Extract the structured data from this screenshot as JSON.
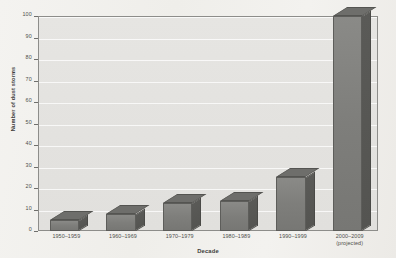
{
  "chart_data": {
    "type": "bar",
    "title": "",
    "xlabel": "Decade",
    "ylabel": "Number of dust storms",
    "categories": [
      "1950–1959",
      "1960–1969",
      "1970–1979",
      "1980–1989",
      "1990–1999",
      "2000–2009\n(projected)"
    ],
    "category_lines": [
      [
        "1950–1959"
      ],
      [
        "1960–1969"
      ],
      [
        "1970–1979"
      ],
      [
        "1980–1989"
      ],
      [
        "1990–1999"
      ],
      [
        "2000–2009",
        "(projected)"
      ]
    ],
    "values": [
      5,
      8,
      13,
      14,
      25,
      100
    ],
    "ylim": [
      0,
      100
    ],
    "yticks": [
      0,
      10,
      20,
      30,
      40,
      50,
      60,
      70,
      80,
      90,
      100
    ],
    "ytick_labels": [
      "0",
      "10",
      "20",
      "30",
      "40",
      "50",
      "60",
      "70",
      "80",
      "90",
      "100"
    ],
    "grid": true,
    "grid_axis": "y",
    "legend": "none",
    "bar_style": "3d",
    "colors": {
      "bar_front": "#7e7e7b",
      "bar_side": "#57574f",
      "bar_top": "#6e6e6b",
      "plot_background": "#e4e3e0",
      "page_background": "#f2f1ee",
      "axis": "#6f6f6c",
      "text": "#4e4e4b"
    }
  }
}
